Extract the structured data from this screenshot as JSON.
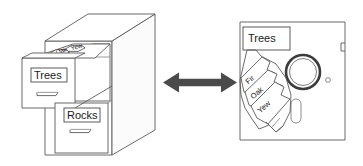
{
  "diagram": {
    "title": "Filing cabinet and floppy disk analogy",
    "background_color": "#ffffff",
    "line_color": "#5a5a5a",
    "text_color": "#1a1a1a",
    "arrow_color": "#4a4a4a"
  },
  "cabinet": {
    "name": "filing-cabinet",
    "open_drawer_label": "Trees",
    "closed_drawer_label": "Rocks",
    "folder_tabs": [
      {
        "label": "Fir"
      },
      {
        "label": "Oak"
      },
      {
        "label": "Yew"
      }
    ]
  },
  "connector": {
    "name": "double-headed-arrow",
    "direction": "bidirectional",
    "color": "#4a4a4a"
  },
  "floppy": {
    "name": "floppy-disk",
    "disk_label": "Trees",
    "fan_tabs": [
      {
        "label": "Fir"
      },
      {
        "label": "Oak"
      },
      {
        "label": "Yew"
      }
    ]
  }
}
